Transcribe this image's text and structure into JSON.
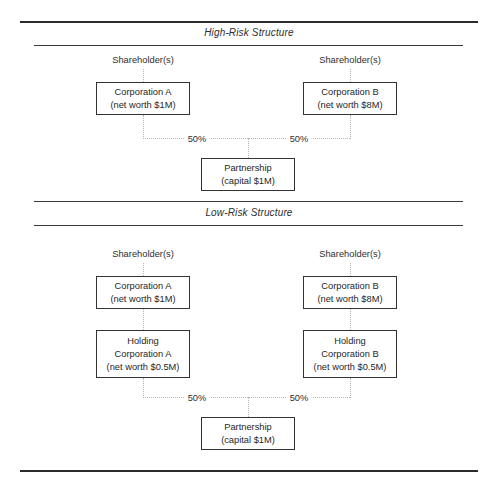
{
  "diagram": {
    "sections": [
      {
        "id": "high-risk",
        "title": "High-Risk Structure",
        "shareholder_left": "Shareholder(s)",
        "shareholder_right": "Shareholder(s)",
        "corp_left": {
          "line1": "Corporation A",
          "line2": "(net worth $1M)"
        },
        "corp_right": {
          "line1": "Corporation B",
          "line2": "(net worth $8M)"
        },
        "partnership": {
          "line1": "Partnership",
          "line2": "(capital $1M)"
        },
        "pct_left": "50%",
        "pct_right": "50%"
      },
      {
        "id": "low-risk",
        "title": "Low-Risk Structure",
        "shareholder_left": "Shareholder(s)",
        "shareholder_right": "Shareholder(s)",
        "corp_left": {
          "line1": "Corporation A",
          "line2": "(net worth $1M)"
        },
        "corp_right": {
          "line1": "Corporation B",
          "line2": "(net worth $8M)"
        },
        "holding_left": {
          "line1": "Holding",
          "line2": "Corporation A",
          "line3": "(net worth $0.5M)"
        },
        "holding_right": {
          "line1": "Holding",
          "line2": "Corporation B",
          "line3": "(net worth $0.5M)"
        },
        "partnership": {
          "line1": "Partnership",
          "line2": "(capital $1M)"
        },
        "pct_left": "50%",
        "pct_right": "50%"
      }
    ],
    "colors": {
      "rule": "#2b2b2b",
      "box_border": "#333333",
      "text": "#262626",
      "connector": "#b6b6b6",
      "background": "#ffffff"
    }
  }
}
